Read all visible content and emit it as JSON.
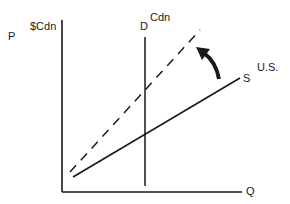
{
  "diagram": {
    "type": "supply-demand",
    "y_axis": {
      "label": "P",
      "unit": "$Cdn"
    },
    "x_axis": {
      "label": "Q"
    },
    "demand": {
      "label": "D",
      "market": "Cdn"
    },
    "supply": {
      "label": "S",
      "source": "U.S."
    },
    "shifted_supply": {
      "style": "dashed"
    },
    "shift_arrow": {
      "direction": "up-left"
    }
  },
  "colors": {
    "ink": "#1a1a1a",
    "background": "#ffffff"
  }
}
